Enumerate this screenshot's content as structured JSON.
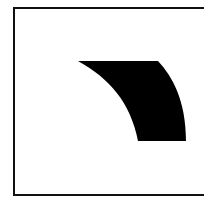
{
  "figure": {
    "background": "#ffffff",
    "frame": {
      "stroke": "#111111",
      "stroke_width": 2,
      "left": 14,
      "top": 8,
      "right": 206,
      "bottom": 195
    },
    "shape": {
      "fill": "#000000",
      "description": "curved quadrilateral wedge",
      "path": "M78,61 L158,61 C172,76 186,100 186,141 L138,141 C130,102 110,79 78,61 Z"
    }
  }
}
